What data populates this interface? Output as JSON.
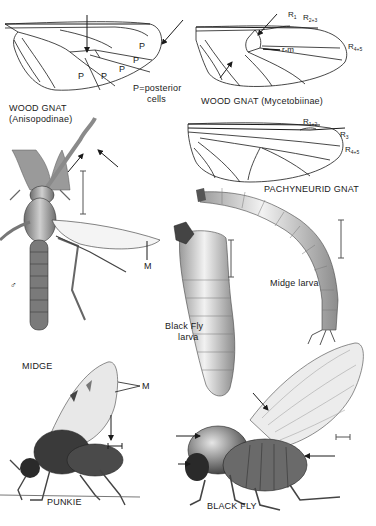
{
  "plate": {
    "figures": [
      {
        "id": "wood-gnat-anisopodinae",
        "title": "WOOD GNAT",
        "subtitle": "(Anisopodinae)",
        "type": "wing"
      },
      {
        "id": "wood-gnat-mycetobiinae",
        "title": "WOOD GNAT (Mycetobiinae)",
        "type": "wing"
      },
      {
        "id": "pachyneurid-gnat",
        "title": "PACHYNEURID GNAT",
        "type": "wing"
      },
      {
        "id": "midge",
        "title": "MIDGE",
        "type": "adult",
        "sex_symbol": "♂"
      },
      {
        "id": "midge-larva",
        "title": "Midge larva",
        "type": "larva"
      },
      {
        "id": "black-fly-larva",
        "title": "Black Fly larva",
        "line1": "Black Fly",
        "line2": "larva",
        "type": "larva"
      },
      {
        "id": "punkie",
        "title": "PUNKIE",
        "type": "adult"
      },
      {
        "id": "black-fly",
        "title": "BLACK FLY",
        "type": "adult"
      }
    ]
  },
  "labels": {
    "anisopodinae": {
      "cell_marker": "P",
      "legend_line1": "P=posterior",
      "legend_line2": "cells",
      "title": "WOOD GNAT",
      "subtitle": "(Anisopodinae)"
    },
    "mycetobiinae": {
      "r1": "R",
      "r1_sub": "1",
      "r23": "R",
      "r23_sub": "2+3",
      "rm": "r-m",
      "r45": "R",
      "r45_sub": "4+5",
      "title": "WOOD GNAT (Mycetobiinae)"
    },
    "pachyneurid": {
      "r12": "R",
      "r12_sub": "1+2",
      "r3": "R",
      "r3_sub": "3",
      "r45": "R",
      "r45_sub": "4+5",
      "title": "PACHYNEURID GNAT"
    },
    "midge": {
      "title": "MIDGE",
      "vein": "M",
      "sex": "♂"
    },
    "midge_larva": {
      "title": "Midge larva"
    },
    "black_fly_larva": {
      "line1": "Black Fly",
      "line2": "larva"
    },
    "punkie": {
      "title": "PUNKIE",
      "vein": "M"
    },
    "black_fly": {
      "title": "BLACK FLY"
    }
  },
  "colors": {
    "ink": "#1a1a1a",
    "shade": "#8a8a8a",
    "light_shade": "#cfcfcf",
    "background": "#ffffff"
  }
}
